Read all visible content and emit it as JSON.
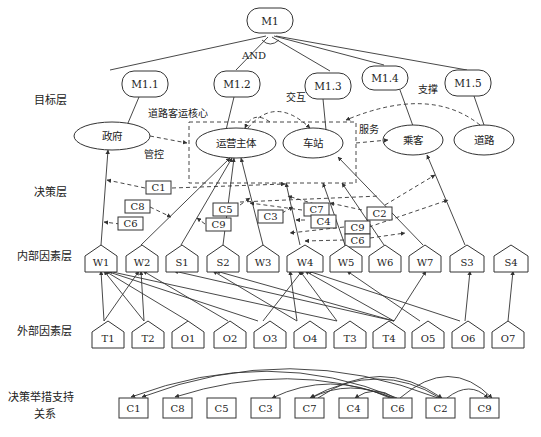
{
  "layers": {
    "goal": "目标层",
    "decision": "决策层",
    "internal": "内部因素层",
    "external": "外部因素层",
    "support_line1": "决策举措支持",
    "support_line2": "关系"
  },
  "root": {
    "id": "M1",
    "label": "M1",
    "x": 270,
    "y": 19
  },
  "and_label": "AND",
  "goals": [
    {
      "id": "M1.1",
      "label": "M1.1",
      "x": 98,
      "y": 85
    },
    {
      "id": "M1.2",
      "label": "M1.2",
      "x": 240,
      "y": 85
    },
    {
      "id": "M1.3",
      "label": "M1.3",
      "x": 326,
      "y": 85
    },
    {
      "id": "M1.4",
      "label": "M1.4",
      "x": 388,
      "y": 78
    },
    {
      "id": "M1.5",
      "label": "M1.5",
      "x": 472,
      "y": 85
    }
  ],
  "actors": [
    {
      "id": "gov",
      "label": "政府",
      "x": 112,
      "y": 136,
      "rx": 38,
      "ry": 14
    },
    {
      "id": "operator",
      "label": "运营主体",
      "x": 236,
      "y": 143,
      "rx": 40,
      "ry": 15
    },
    {
      "id": "station",
      "label": "车站",
      "x": 313,
      "y": 143,
      "rx": 30,
      "ry": 15
    },
    {
      "id": "passenger",
      "label": "乘客",
      "x": 413,
      "y": 140,
      "rx": 30,
      "ry": 15
    },
    {
      "id": "road",
      "label": "道路",
      "x": 484,
      "y": 140,
      "rx": 30,
      "ry": 15
    }
  ],
  "annotations": {
    "core": "道路客运核心",
    "interact": "交互",
    "support": "支撑",
    "service": "服务",
    "control": "管控"
  },
  "decisions": [
    {
      "label": "C1",
      "x": 158,
      "y": 188
    },
    {
      "label": "C8",
      "x": 137,
      "y": 207
    },
    {
      "label": "C6",
      "x": 132,
      "y": 224
    },
    {
      "label": "C5",
      "x": 228,
      "y": 208
    },
    {
      "label": "C9",
      "x": 217,
      "y": 224
    },
    {
      "label": "C3",
      "x": 268,
      "y": 216
    },
    {
      "label": "C7",
      "x": 315,
      "y": 208
    },
    {
      "label": "C4",
      "x": 321,
      "y": 220
    },
    {
      "label": "C2",
      "x": 377,
      "y": 213
    },
    {
      "label": "C9",
      "x": 357,
      "y": 227
    },
    {
      "label": "C6",
      "x": 357,
      "y": 240
    }
  ],
  "internal_factors": [
    {
      "label": "W1",
      "x": 101
    },
    {
      "label": "W2",
      "x": 141
    },
    {
      "label": "S1",
      "x": 181
    },
    {
      "label": "S2",
      "x": 223
    },
    {
      "label": "W3",
      "x": 263
    },
    {
      "label": "W4",
      "x": 305
    },
    {
      "label": "W5",
      "x": 345
    },
    {
      "label": "W6",
      "x": 384
    },
    {
      "label": "W7",
      "x": 423
    },
    {
      "label": "S3",
      "x": 465
    },
    {
      "label": "S4",
      "x": 510
    }
  ],
  "external_factors": [
    {
      "label": "T1",
      "x": 108
    },
    {
      "label": "T2",
      "x": 148
    },
    {
      "label": "O1",
      "x": 188
    },
    {
      "label": "O2",
      "x": 230
    },
    {
      "label": "O3",
      "x": 270
    },
    {
      "label": "O4",
      "x": 310
    },
    {
      "label": "T3",
      "x": 350
    },
    {
      "label": "T4",
      "x": 389
    },
    {
      "label": "O5",
      "x": 428
    },
    {
      "label": "O6",
      "x": 468
    },
    {
      "label": "O7",
      "x": 508
    }
  ],
  "support_boxes": [
    {
      "label": "C1",
      "x": 134
    },
    {
      "label": "C8",
      "x": 178
    },
    {
      "label": "C5",
      "x": 222
    },
    {
      "label": "C3",
      "x": 266
    },
    {
      "label": "C7",
      "x": 310
    },
    {
      "label": "C4",
      "x": 354
    },
    {
      "label": "C6",
      "x": 398
    },
    {
      "label": "C2",
      "x": 441
    },
    {
      "label": "C9",
      "x": 485
    }
  ],
  "external_to_internal_edges": [
    [
      "T1",
      "W1"
    ],
    [
      "T1",
      "W2"
    ],
    [
      "T2",
      "W1"
    ],
    [
      "T2",
      "W2"
    ],
    [
      "O1",
      "W1"
    ],
    [
      "O2",
      "W2"
    ],
    [
      "O3",
      "W1"
    ],
    [
      "O3",
      "W4"
    ],
    [
      "O4",
      "W4"
    ],
    [
      "O4",
      "S2"
    ],
    [
      "T3",
      "W4"
    ],
    [
      "T3",
      "W1"
    ],
    [
      "T4",
      "W4"
    ],
    [
      "T4",
      "S2"
    ],
    [
      "T4",
      "W7"
    ],
    [
      "T4",
      "S1"
    ],
    [
      "O5",
      "W5"
    ],
    [
      "O5",
      "W4"
    ],
    [
      "O6",
      "W4"
    ],
    [
      "O6",
      "S3"
    ],
    [
      "O7",
      "S4"
    ]
  ],
  "support_arcs": [
    [
      "C6",
      "C1"
    ],
    [
      "C2",
      "C1"
    ],
    [
      "C6",
      "C8"
    ],
    [
      "C6",
      "C3"
    ],
    [
      "C2",
      "C7"
    ],
    [
      "C6",
      "C7"
    ],
    [
      "C6",
      "C4"
    ],
    [
      "C6",
      "C2"
    ],
    [
      "C6",
      "C9"
    ],
    [
      "C2",
      "C9"
    ],
    [
      "C7",
      "C2"
    ]
  ]
}
